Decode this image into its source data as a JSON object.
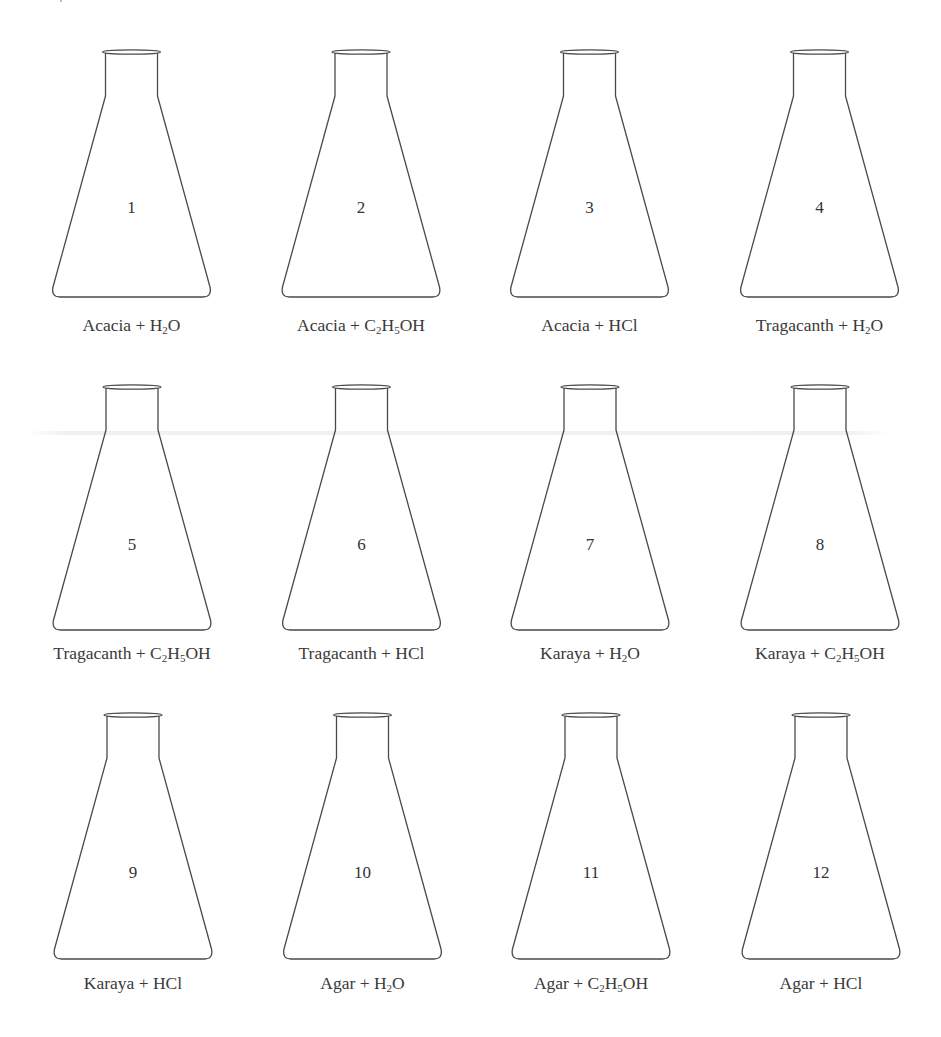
{
  "figure": {
    "layout": {
      "columns": 4,
      "rows": 3
    },
    "colors": {
      "stroke": "#4a4a4a",
      "text": "#333333",
      "background": "#ffffff"
    },
    "flasks": [
      {
        "number": "1",
        "substance": "Acacia",
        "reagent": [
          {
            "t": "H"
          },
          {
            "s": "2"
          },
          {
            "t": "O"
          }
        ],
        "label_text": "Acacia + H2O"
      },
      {
        "number": "2",
        "substance": "Acacia",
        "reagent": [
          {
            "t": "C"
          },
          {
            "s": "2"
          },
          {
            "t": "H"
          },
          {
            "s": "5"
          },
          {
            "t": "OH"
          }
        ],
        "label_text": "Acacia + C2H5OH"
      },
      {
        "number": "3",
        "substance": "Acacia",
        "reagent": [
          {
            "t": "HCl"
          }
        ],
        "label_text": "Acacia + HCl"
      },
      {
        "number": "4",
        "substance": "Tragacanth",
        "reagent": [
          {
            "t": "H"
          },
          {
            "s": "2"
          },
          {
            "t": "O"
          }
        ],
        "label_text": "Tragacanth + H2O"
      },
      {
        "number": "5",
        "substance": "Tragacanth",
        "reagent": [
          {
            "t": "C"
          },
          {
            "s": "2"
          },
          {
            "t": "H"
          },
          {
            "s": "5"
          },
          {
            "t": "OH"
          }
        ],
        "label_text": "Tragacanth + C2H5OH"
      },
      {
        "number": "6",
        "substance": "Tragacanth",
        "reagent": [
          {
            "t": "HCl"
          }
        ],
        "label_text": "Tragacanth + HCl"
      },
      {
        "number": "7",
        "substance": "Karaya",
        "reagent": [
          {
            "t": "H"
          },
          {
            "s": "2"
          },
          {
            "t": "O"
          }
        ],
        "label_text": "Karaya + H2O"
      },
      {
        "number": "8",
        "substance": "Karaya",
        "reagent": [
          {
            "t": "C"
          },
          {
            "s": "2"
          },
          {
            "t": "H"
          },
          {
            "s": "5"
          },
          {
            "t": "OH"
          }
        ],
        "label_text": "Karaya + C2H5OH"
      },
      {
        "number": "9",
        "substance": "Karaya",
        "reagent": [
          {
            "t": "HCl"
          }
        ],
        "label_text": "Karaya + HCl"
      },
      {
        "number": "10",
        "substance": "Agar",
        "reagent": [
          {
            "t": "H"
          },
          {
            "s": "2"
          },
          {
            "t": "O"
          }
        ],
        "label_text": "Agar + H2O"
      },
      {
        "number": "11",
        "substance": "Agar",
        "reagent": [
          {
            "t": "C"
          },
          {
            "s": "2"
          },
          {
            "t": "H"
          },
          {
            "s": "5"
          },
          {
            "t": "OH"
          }
        ],
        "label_text": "Agar + C2H5OH"
      },
      {
        "number": "12",
        "substance": "Agar",
        "reagent": [
          {
            "t": "HCl"
          }
        ],
        "label_text": "Agar + HCl"
      }
    ]
  }
}
